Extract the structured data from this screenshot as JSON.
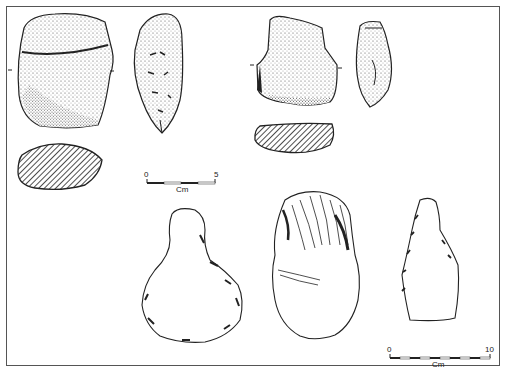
{
  "figure": {
    "type": "archaeological lithic illustration",
    "colors": {
      "ink": "#222222",
      "frame": "#555555",
      "background": "#ffffff"
    }
  },
  "scale_bars": [
    {
      "id": "small",
      "start_label": "0",
      "end_label": "5",
      "unit": "Cm"
    },
    {
      "id": "large",
      "start_label": "0",
      "end_label": "10",
      "unit": "Cm"
    }
  ],
  "artifacts": [
    {
      "name": "stippled-core-face-1"
    },
    {
      "name": "stippled-core-profile-1"
    },
    {
      "name": "hatched-section-1"
    },
    {
      "name": "stippled-core-face-2"
    },
    {
      "name": "stippled-core-profile-2"
    },
    {
      "name": "hatched-section-2"
    },
    {
      "name": "retouched-flake-outline"
    },
    {
      "name": "flaked-core-tool"
    },
    {
      "name": "retouched-blade-fragment"
    }
  ]
}
